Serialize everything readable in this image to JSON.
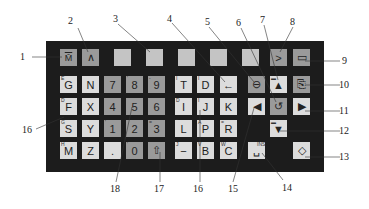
{
  "diagram": {
    "type": "machine control keypad",
    "rows": [
      [
        {
          "id": "k-m",
          "label": "M̄",
          "shade": "mid"
        },
        {
          "id": "k-caret",
          "label": "∧",
          "shade": "mid"
        },
        {
          "id": "k-blank1",
          "label": "",
          "shade": "pale"
        },
        {
          "id": "k-blank2",
          "label": "",
          "shade": "pale"
        },
        {
          "id": "k-blank3",
          "label": "",
          "shade": "pale"
        },
        {
          "id": "k-blank4",
          "label": "",
          "shade": "pale"
        },
        {
          "id": "k-blank5",
          "label": "",
          "shade": "pale"
        },
        {
          "id": "k-gt",
          "label": ">",
          "shade": "mid"
        },
        {
          "id": "k-screen",
          "label": "▭",
          "shade": "mid"
        }
      ],
      [
        {
          "id": "k-g",
          "label": "G",
          "sup": "E",
          "shade": "light"
        },
        {
          "id": "k-n",
          "label": "N",
          "shade": "light"
        },
        {
          "id": "k-7",
          "label": "7",
          "shade": "mid"
        },
        {
          "id": "k-8",
          "label": "8",
          "sup": "'",
          "shade": "mid"
        },
        {
          "id": "k-9",
          "label": "9",
          "sup": "-",
          "shade": "mid"
        },
        {
          "id": "k-t",
          "label": "T",
          "sup": "I",
          "shade": "light"
        },
        {
          "id": "k-d",
          "label": "D",
          "sup": "I",
          "shade": "light"
        },
        {
          "id": "k-back",
          "label": "←",
          "shade": "light"
        },
        {
          "id": "k-delete",
          "label": "⊖",
          "shade": "mid"
        },
        {
          "id": "k-pageup",
          "label": "▲",
          "sup": "▬",
          "shade": "light"
        },
        {
          "id": "k-shift-screen",
          "label": "⎘",
          "shade": "mid"
        }
      ],
      [
        {
          "id": "k-f",
          "label": "F",
          "sup": "D",
          "shade": "light"
        },
        {
          "id": "k-x",
          "label": "X",
          "shade": "light"
        },
        {
          "id": "k-4",
          "label": "4",
          "shade": "mid"
        },
        {
          "id": "k-5",
          "label": "5",
          "shade": "mid"
        },
        {
          "id": "k-6",
          "label": "6",
          "shade": "mid"
        },
        {
          "id": "k-i",
          "label": "I",
          "sup": "D",
          "shade": "light"
        },
        {
          "id": "k-j",
          "label": "J",
          "sup": "I",
          "shade": "light"
        },
        {
          "id": "k-k",
          "label": "K",
          "shade": "light"
        },
        {
          "id": "k-left",
          "label": "◀",
          "shade": "light"
        },
        {
          "id": "k-reset",
          "label": "↺",
          "shade": "mid"
        },
        {
          "id": "k-right",
          "label": "▶",
          "shade": "light"
        }
      ],
      [
        {
          "id": "k-s",
          "label": "S",
          "sup": "G",
          "shade": "light"
        },
        {
          "id": "k-y",
          "label": "Y",
          "shade": "light"
        },
        {
          "id": "k-1",
          "label": "1",
          "sup": "'",
          "shade": "mid"
        },
        {
          "id": "k-2",
          "label": "2",
          "shade": "mid"
        },
        {
          "id": "k-3",
          "label": "3",
          "sup": "=",
          "shade": "mid"
        },
        {
          "id": "k-l",
          "label": "L",
          "sup": "‾",
          "shade": "light"
        },
        {
          "id": "k-p",
          "label": "P",
          "sup": "A",
          "shade": "light"
        },
        {
          "id": "k-r",
          "label": "R",
          "sup": "=",
          "shade": "light"
        },
        {
          "id": "k-pagedown",
          "label": "▼",
          "sup": "▬",
          "shade": "light"
        }
      ],
      [
        {
          "id": "k-mm",
          "label": "M",
          "sup": "H",
          "shade": "light"
        },
        {
          "id": "k-z",
          "label": "Z",
          "shade": "light"
        },
        {
          "id": "k-dot",
          "label": ".",
          "shade": "light"
        },
        {
          "id": "k-0",
          "label": "0",
          "sup": "'",
          "shade": "mid"
        },
        {
          "id": "k-shift",
          "label": "⇧",
          "shade": "mid"
        },
        {
          "id": "k-minus",
          "label": "−",
          "sup": "J",
          "shade": "light"
        },
        {
          "id": "k-b",
          "label": "B",
          "sup": "V",
          "shade": "light"
        },
        {
          "id": "k-c",
          "label": "C",
          "sup": "W",
          "shade": "light"
        },
        {
          "id": "k-insert",
          "label": "␣",
          "sup": "INS",
          "shade": "light"
        },
        {
          "id": "k-input",
          "label": "◇",
          "shade": "light"
        }
      ]
    ],
    "callouts": [
      "1",
      "2",
      "3",
      "4",
      "5",
      "6",
      "7",
      "8",
      "9",
      "10",
      "11",
      "12",
      "13",
      "14",
      "15",
      "16",
      "16",
      "17",
      "18"
    ]
  }
}
